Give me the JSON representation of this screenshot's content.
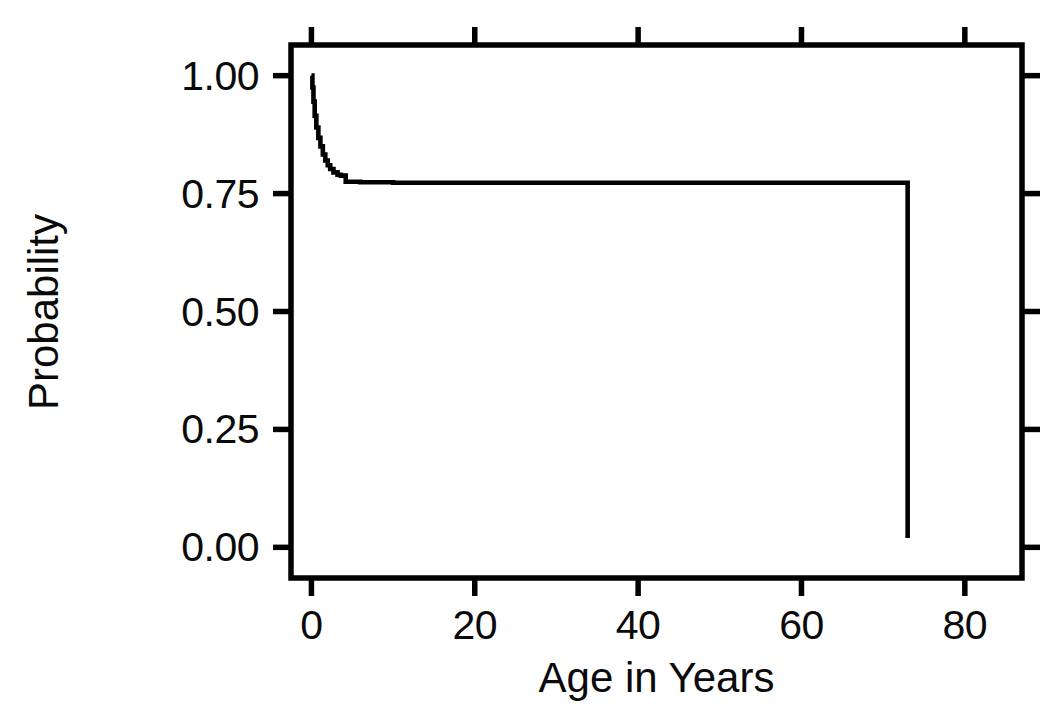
{
  "chart_data": {
    "type": "line",
    "title": "",
    "subtitle": "",
    "xlabel": "Age in Years",
    "ylabel": "Probability",
    "xlim": [
      -2.5,
      87.0
    ],
    "ylim": [
      -0.065,
      1.065
    ],
    "xticks": [
      0,
      20,
      40,
      60,
      80
    ],
    "xticklabels": [
      "0",
      "20",
      "40",
      "60",
      "80"
    ],
    "yticks": [
      0.0,
      0.25,
      0.5,
      0.75,
      1.0
    ],
    "yticklabels": [
      "0.00",
      "0.25",
      "0.50",
      "0.75",
      "1.00"
    ],
    "grid": false,
    "legend": null,
    "legend_position": "none",
    "line_color": "#000000",
    "axis_color": "#000000",
    "background_color": "#ffffff",
    "annotations": [],
    "series": [
      {
        "name": "Survival probability",
        "step": "post",
        "x": [
          0.0,
          0.12,
          0.25,
          0.4,
          0.6,
          0.85,
          1.1,
          1.4,
          1.7,
          2.0,
          2.3,
          2.7,
          3.2,
          3.6,
          4.2,
          6.0,
          10.0,
          20.0,
          30.0,
          40.0,
          50.0,
          60.0,
          70.0,
          73.0,
          73.0
        ],
        "y": [
          1.0,
          0.975,
          0.945,
          0.915,
          0.89,
          0.868,
          0.85,
          0.833,
          0.82,
          0.81,
          0.802,
          0.795,
          0.79,
          0.788,
          0.775,
          0.774,
          0.773,
          0.773,
          0.773,
          0.773,
          0.773,
          0.773,
          0.773,
          0.773,
          0.02
        ]
      }
    ]
  },
  "axis_ticks": {
    "y": [
      {
        "label": "1.00",
        "value": 1.0
      },
      {
        "label": "0.75",
        "value": 0.75
      },
      {
        "label": "0.50",
        "value": 0.5
      },
      {
        "label": "0.25",
        "value": 0.25
      },
      {
        "label": "0.00",
        "value": 0.0
      }
    ],
    "x": [
      {
        "label": "0",
        "value": 0
      },
      {
        "label": "20",
        "value": 20
      },
      {
        "label": "40",
        "value": 40
      },
      {
        "label": "60",
        "value": 60
      },
      {
        "label": "80",
        "value": 80
      }
    ]
  },
  "labels": {
    "y_axis_title": "Probability",
    "x_axis_title": "Age in Years"
  }
}
